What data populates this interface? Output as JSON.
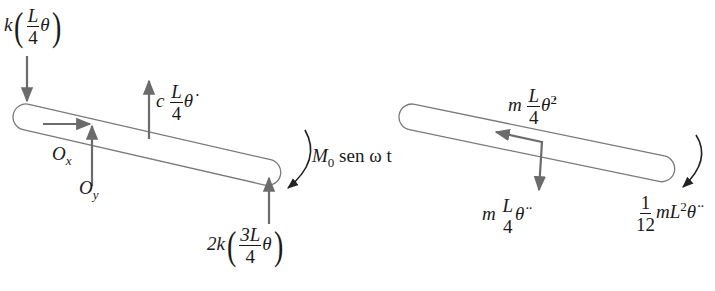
{
  "figure": {
    "type": "free-body-diagram",
    "colors": {
      "arrow": "#6b6b6b",
      "outline": "#7a7a7a",
      "text": "#1a1a1a",
      "background": "#ffffff"
    }
  },
  "left_diagram": {
    "title": "external forces",
    "spring_left": {
      "coef": "k",
      "num": "L",
      "den": "4",
      "var": "θ"
    },
    "damper": {
      "coef": "c",
      "num": "L",
      "den": "4",
      "var": "θ̇"
    },
    "pin_x": {
      "base": "O",
      "sub": "x"
    },
    "pin_y": {
      "base": "O",
      "sub": "y"
    },
    "moment": {
      "base": "M",
      "sub": "0",
      "rest": " sen ω t"
    },
    "spring_right": {
      "coef": "2k",
      "num": "3L",
      "den": "4",
      "var": "θ"
    }
  },
  "right_diagram": {
    "title": "inertial / kinetic diagram",
    "normal_accel": {
      "coef": "m",
      "num": "L",
      "den": "4",
      "var": "θ̇",
      "sup": "2"
    },
    "tangential_accel": {
      "coef": "m",
      "num": "L",
      "den": "4",
      "var": "θ̈"
    },
    "angular": {
      "num": "1",
      "den": "12",
      "rest": "mL",
      "sup": "2",
      "var": "θ̈"
    }
  }
}
